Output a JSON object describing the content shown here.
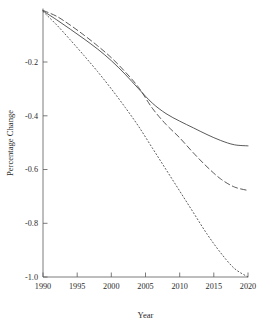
{
  "chart_data": {
    "type": "line",
    "title": "",
    "subtitle": "",
    "xlabel": "Year",
    "ylabel": "Percentage Change",
    "xlim": [
      1990,
      2020
    ],
    "ylim": [
      -1.0,
      0.0
    ],
    "grid": false,
    "legend": "none",
    "xticks": [
      1990,
      1995,
      2000,
      2005,
      2010,
      2015,
      2020
    ],
    "xtick_labels": [
      "1990",
      "1995",
      "2000",
      "2005",
      "2010",
      "2015",
      "2020"
    ],
    "yticks": [
      -0.2,
      -0.4,
      -0.6,
      -0.8,
      -1.0
    ],
    "ytick_labels": [
      "-0.2",
      "-0.4",
      "-0.6",
      "-0.8",
      "-1.0"
    ],
    "x": [
      1990,
      1992,
      1994,
      1996,
      1998,
      2000,
      2002,
      2004,
      2006,
      2008,
      2010,
      2012,
      2014,
      2016,
      2018,
      2020
    ],
    "series": [
      {
        "name": "solid-series",
        "style": "solid",
        "color": "#3c3c3c",
        "values": [
          -0.01,
          -0.043,
          -0.078,
          -0.114,
          -0.152,
          -0.195,
          -0.245,
          -0.3,
          -0.353,
          -0.392,
          -0.42,
          -0.445,
          -0.47,
          -0.492,
          -0.508,
          -0.512
        ]
      },
      {
        "name": "dashed-series",
        "style": "dashed",
        "color": "#3c3c3c",
        "values": [
          -0.008,
          -0.03,
          -0.063,
          -0.1,
          -0.14,
          -0.184,
          -0.236,
          -0.295,
          -0.372,
          -0.432,
          -0.482,
          -0.538,
          -0.59,
          -0.635,
          -0.665,
          -0.678
        ]
      },
      {
        "name": "dotted-series",
        "style": "dotted",
        "color": "#3c3c3c",
        "values": [
          -0.012,
          -0.062,
          -0.118,
          -0.176,
          -0.236,
          -0.3,
          -0.368,
          -0.44,
          -0.52,
          -0.6,
          -0.68,
          -0.76,
          -0.84,
          -0.91,
          -0.968,
          -1.0
        ]
      }
    ]
  },
  "axes": {
    "x_axis_name": "year-axis",
    "y_axis_name": "percentage-change-axis"
  }
}
